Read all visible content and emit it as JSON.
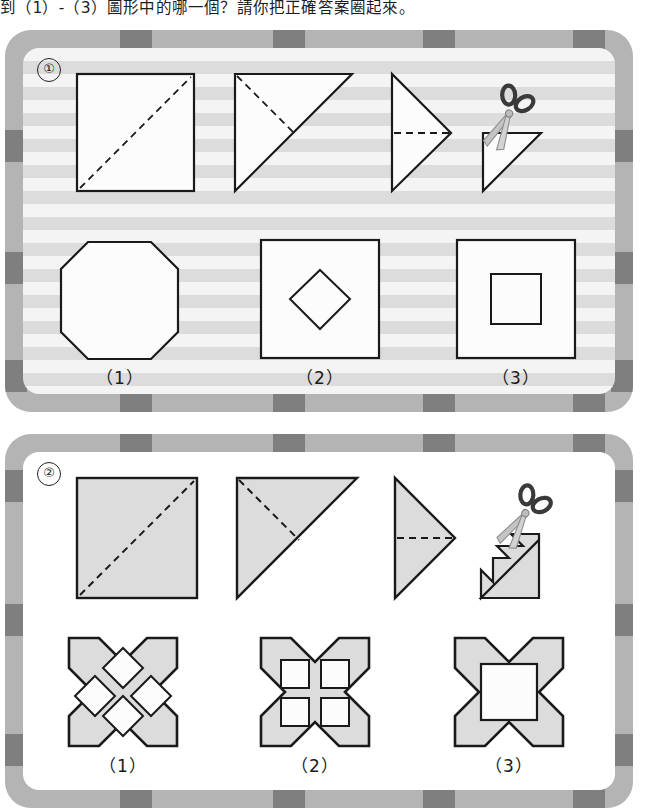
{
  "question": {
    "text": "到（1）-（3）圖形中的哪一個？請你把正確答案圈起來。"
  },
  "colors": {
    "frame": "#b4b4b4",
    "frame_tick": "#7f7f7f",
    "stripe_light": "#f4f4f4",
    "stripe_dark": "#dcdcdc",
    "shape_fill_gray": "#dcdcdc",
    "shape_fill_white": "#fcfcfc",
    "outline": "#1a1a1a",
    "scissor_dark": "#3a3a3a",
    "scissor_blade": "#b9b9b9"
  },
  "panels": [
    {
      "id": "panel-1",
      "number": "①",
      "background": "striped",
      "fold_sequence": [
        {
          "name": "square-with-diagonal-fold",
          "shape": "square",
          "fold": "diagonal"
        },
        {
          "name": "triangle-with-fold",
          "shape": "triangle",
          "fold": "diagonal"
        },
        {
          "name": "triangle-pointing-right-with-fold",
          "shape": "triangle-right",
          "fold": "horizontal"
        },
        {
          "name": "triangle-being-cut",
          "shape": "triangle-cut",
          "tool": "scissors-icon"
        }
      ],
      "options": [
        {
          "label": "（1）",
          "name": "option-octagon",
          "shape": "octagon"
        },
        {
          "label": "（2）",
          "name": "option-square-with-diamond-hole",
          "shape": "square-diamond"
        },
        {
          "label": "（3）",
          "name": "option-square-with-square-hole",
          "shape": "square-square"
        }
      ]
    },
    {
      "id": "panel-2",
      "number": "②",
      "background": "plain",
      "fold_sequence": [
        {
          "name": "square-with-diagonal-fold",
          "shape": "square",
          "fold": "diagonal"
        },
        {
          "name": "triangle-with-fold",
          "shape": "triangle",
          "fold": "diagonal"
        },
        {
          "name": "triangle-pointing-right-with-fold",
          "shape": "triangle-right",
          "fold": "horizontal"
        },
        {
          "name": "triangle-being-cut-zigzag",
          "shape": "triangle-zigzag-cut",
          "tool": "scissors-icon"
        }
      ],
      "options": [
        {
          "label": "（1）",
          "name": "option-lattice-four-diamonds",
          "shape": "notched-square-4-diamonds"
        },
        {
          "label": "（2）",
          "name": "option-lattice-four-squares",
          "shape": "notched-square-4-squares"
        },
        {
          "label": "（3）",
          "name": "option-lattice-one-square",
          "shape": "notched-square-1-square"
        }
      ]
    }
  ]
}
